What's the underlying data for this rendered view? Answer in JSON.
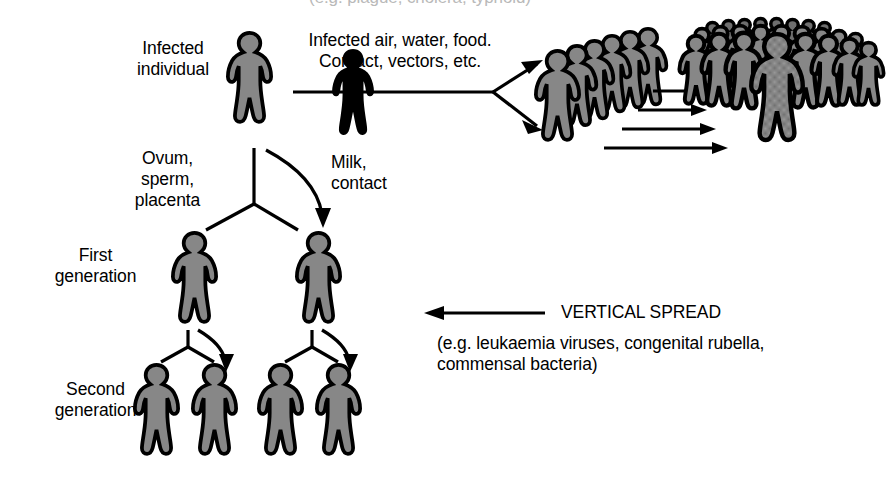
{
  "figure": {
    "title_cut_off": "(e.g. plague, cholera, typhoid)",
    "labels": {
      "infected_individual": "Infected\nindividual",
      "horizontal_transmission": "Infected air, water, food.\nContact, vectors, etc.",
      "ovum_sperm_placenta": "Ovum,\nsperm,\nplacenta",
      "milk_contact": "Milk,\ncontact",
      "first_generation": "First\ngeneration",
      "second_generation": "Second\ngeneration",
      "vertical_spread": "VERTICAL SPREAD",
      "vertical_spread_examples": "(e.g. leukaemia viruses, congenital rubella,\ncommensal bacteria)"
    },
    "colors": {
      "figure_fill": "#8a8a8a",
      "figure_outline": "#000000",
      "background": "#ffffff",
      "text": "#000000"
    },
    "person_icons": {
      "infected_individual_count": 1,
      "first_generation_count": 2,
      "second_generation_count": 4,
      "small_crowd_count": 6,
      "large_crowd_count": 19
    },
    "arrows": {
      "horizontal_spread_branches": 2,
      "crowd_growth_arrows": 4,
      "vertical_spread_arrow_direction": "left",
      "generation_branch_arrows": 3
    }
  }
}
